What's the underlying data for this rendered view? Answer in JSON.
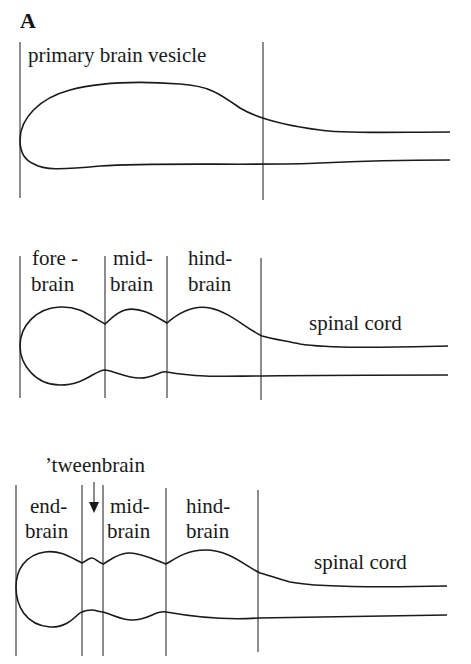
{
  "figure": {
    "panel_label": "A",
    "stage1": {
      "label": "primary brain vesicle"
    },
    "stage2": {
      "regions": [
        {
          "line1": "fore -",
          "line2": "brain"
        },
        {
          "line1": "mid-",
          "line2": "brain"
        },
        {
          "line1": "hind-",
          "line2": "brain"
        }
      ],
      "tail_label": "spinal cord"
    },
    "stage3": {
      "callout": "’tweenbrain",
      "arrow": "↓",
      "regions": [
        {
          "line1": "end-",
          "line2": "brain"
        },
        {
          "line1": "mid-",
          "line2": "brain"
        },
        {
          "line1": "hind-",
          "line2": "brain"
        }
      ],
      "tail_label": "spinal cord"
    }
  }
}
